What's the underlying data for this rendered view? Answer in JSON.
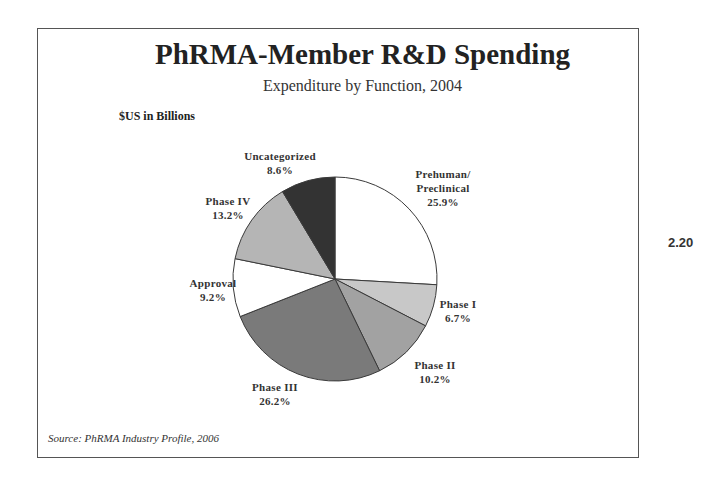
{
  "header": {
    "title": "PhRMA-Member R&D Spending",
    "subtitle": "Expenditure by Function, 2004",
    "units": "$US in Billions"
  },
  "footer": {
    "source": "Source:  PhRMA Industry Profile, 2006"
  },
  "page_number": "2.20",
  "chart_data": {
    "type": "pie",
    "title": "PhRMA-Member R&D Spending",
    "subtitle": "Expenditure by Function, 2004",
    "units": "$US in Billions",
    "start_angle": "12 o'clock",
    "direction": "clockwise",
    "categories": [
      "Prehuman/ Preclinical",
      "Phase I",
      "Phase II",
      "Phase III",
      "Approval",
      "Phase IV",
      "Uncategorized"
    ],
    "values": [
      25.9,
      6.7,
      10.2,
      26.2,
      9.2,
      13.2,
      8.6
    ],
    "value_labels": [
      "25.9%",
      "6.7%",
      "10.2%",
      "26.2%",
      "9.2%",
      "13.2%",
      "8.6%"
    ],
    "colors": [
      "#ffffff",
      "#c8c8c8",
      "#a2a2a2",
      "#7a7a7a",
      "#ffffff",
      "#b5b5b5",
      "#333333"
    ],
    "legend": "none (direct labels)",
    "source": "Source:  PhRMA Industry Profile, 2006"
  },
  "labels": [
    {
      "line1": "Prehuman/",
      "line2": "Preclinical",
      "line3": "25.9%"
    },
    {
      "line1": "Phase I",
      "line2": "6.7%"
    },
    {
      "line1": "Phase II",
      "line2": "10.2%"
    },
    {
      "line1": "Phase III",
      "line2": "26.2%"
    },
    {
      "line1": "Approval",
      "line2": "9.2%"
    },
    {
      "line1": "Phase IV",
      "line2": "13.2%"
    },
    {
      "line1": "Uncategorized",
      "line2": "8.6%"
    }
  ]
}
